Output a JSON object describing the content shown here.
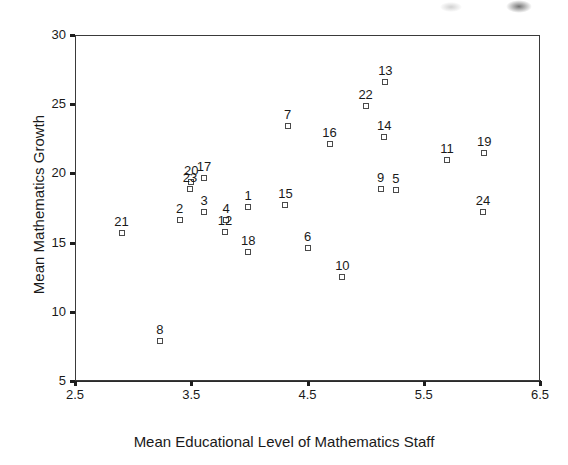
{
  "chart_data": {
    "type": "scatter",
    "title": "",
    "xlabel": "Mean Educational Level of Mathematics Staff",
    "ylabel": "Mean Mathematics Growth",
    "xlim": [
      2.5,
      6.5
    ],
    "ylim": [
      5,
      30
    ],
    "xticks": [
      "2.5",
      "3.5",
      "4.5",
      "5.5",
      "6.5"
    ],
    "xtick_values": [
      2.5,
      3.5,
      4.5,
      5.5,
      6.5
    ],
    "yticks": [
      "5",
      "10",
      "15",
      "20",
      "25",
      "30"
    ],
    "ytick_values": [
      5,
      10,
      15,
      20,
      25,
      30
    ],
    "grid": false,
    "legend": false,
    "marker": "open-square",
    "point_label_position": "above",
    "points": [
      {
        "label": "1",
        "x": 3.99,
        "y": 17.6
      },
      {
        "label": "2",
        "x": 3.4,
        "y": 16.6
      },
      {
        "label": "3",
        "x": 3.61,
        "y": 17.2
      },
      {
        "label": "4",
        "x": 3.8,
        "y": 16.6
      },
      {
        "label": "5",
        "x": 5.26,
        "y": 18.8
      },
      {
        "label": "6",
        "x": 4.5,
        "y": 14.6
      },
      {
        "label": "7",
        "x": 4.33,
        "y": 23.4
      },
      {
        "label": "8",
        "x": 3.23,
        "y": 7.9
      },
      {
        "label": "9",
        "x": 5.13,
        "y": 18.9
      },
      {
        "label": "10",
        "x": 4.8,
        "y": 12.5
      },
      {
        "label": "11",
        "x": 5.7,
        "y": 21.0
      },
      {
        "label": "12",
        "x": 3.79,
        "y": 15.8
      },
      {
        "label": "13",
        "x": 5.17,
        "y": 26.6
      },
      {
        "label": "14",
        "x": 5.16,
        "y": 22.6
      },
      {
        "label": "15",
        "x": 4.31,
        "y": 17.7
      },
      {
        "label": "16",
        "x": 4.69,
        "y": 22.1
      },
      {
        "label": "17",
        "x": 3.61,
        "y": 19.7
      },
      {
        "label": "18",
        "x": 3.99,
        "y": 14.3
      },
      {
        "label": "19",
        "x": 6.02,
        "y": 21.5
      },
      {
        "label": "20",
        "x": 3.5,
        "y": 19.4
      },
      {
        "label": "21",
        "x": 2.9,
        "y": 15.7
      },
      {
        "label": "22",
        "x": 5.0,
        "y": 24.9
      },
      {
        "label": "23",
        "x": 3.49,
        "y": 18.9
      },
      {
        "label": "24",
        "x": 6.01,
        "y": 17.2
      }
    ]
  }
}
